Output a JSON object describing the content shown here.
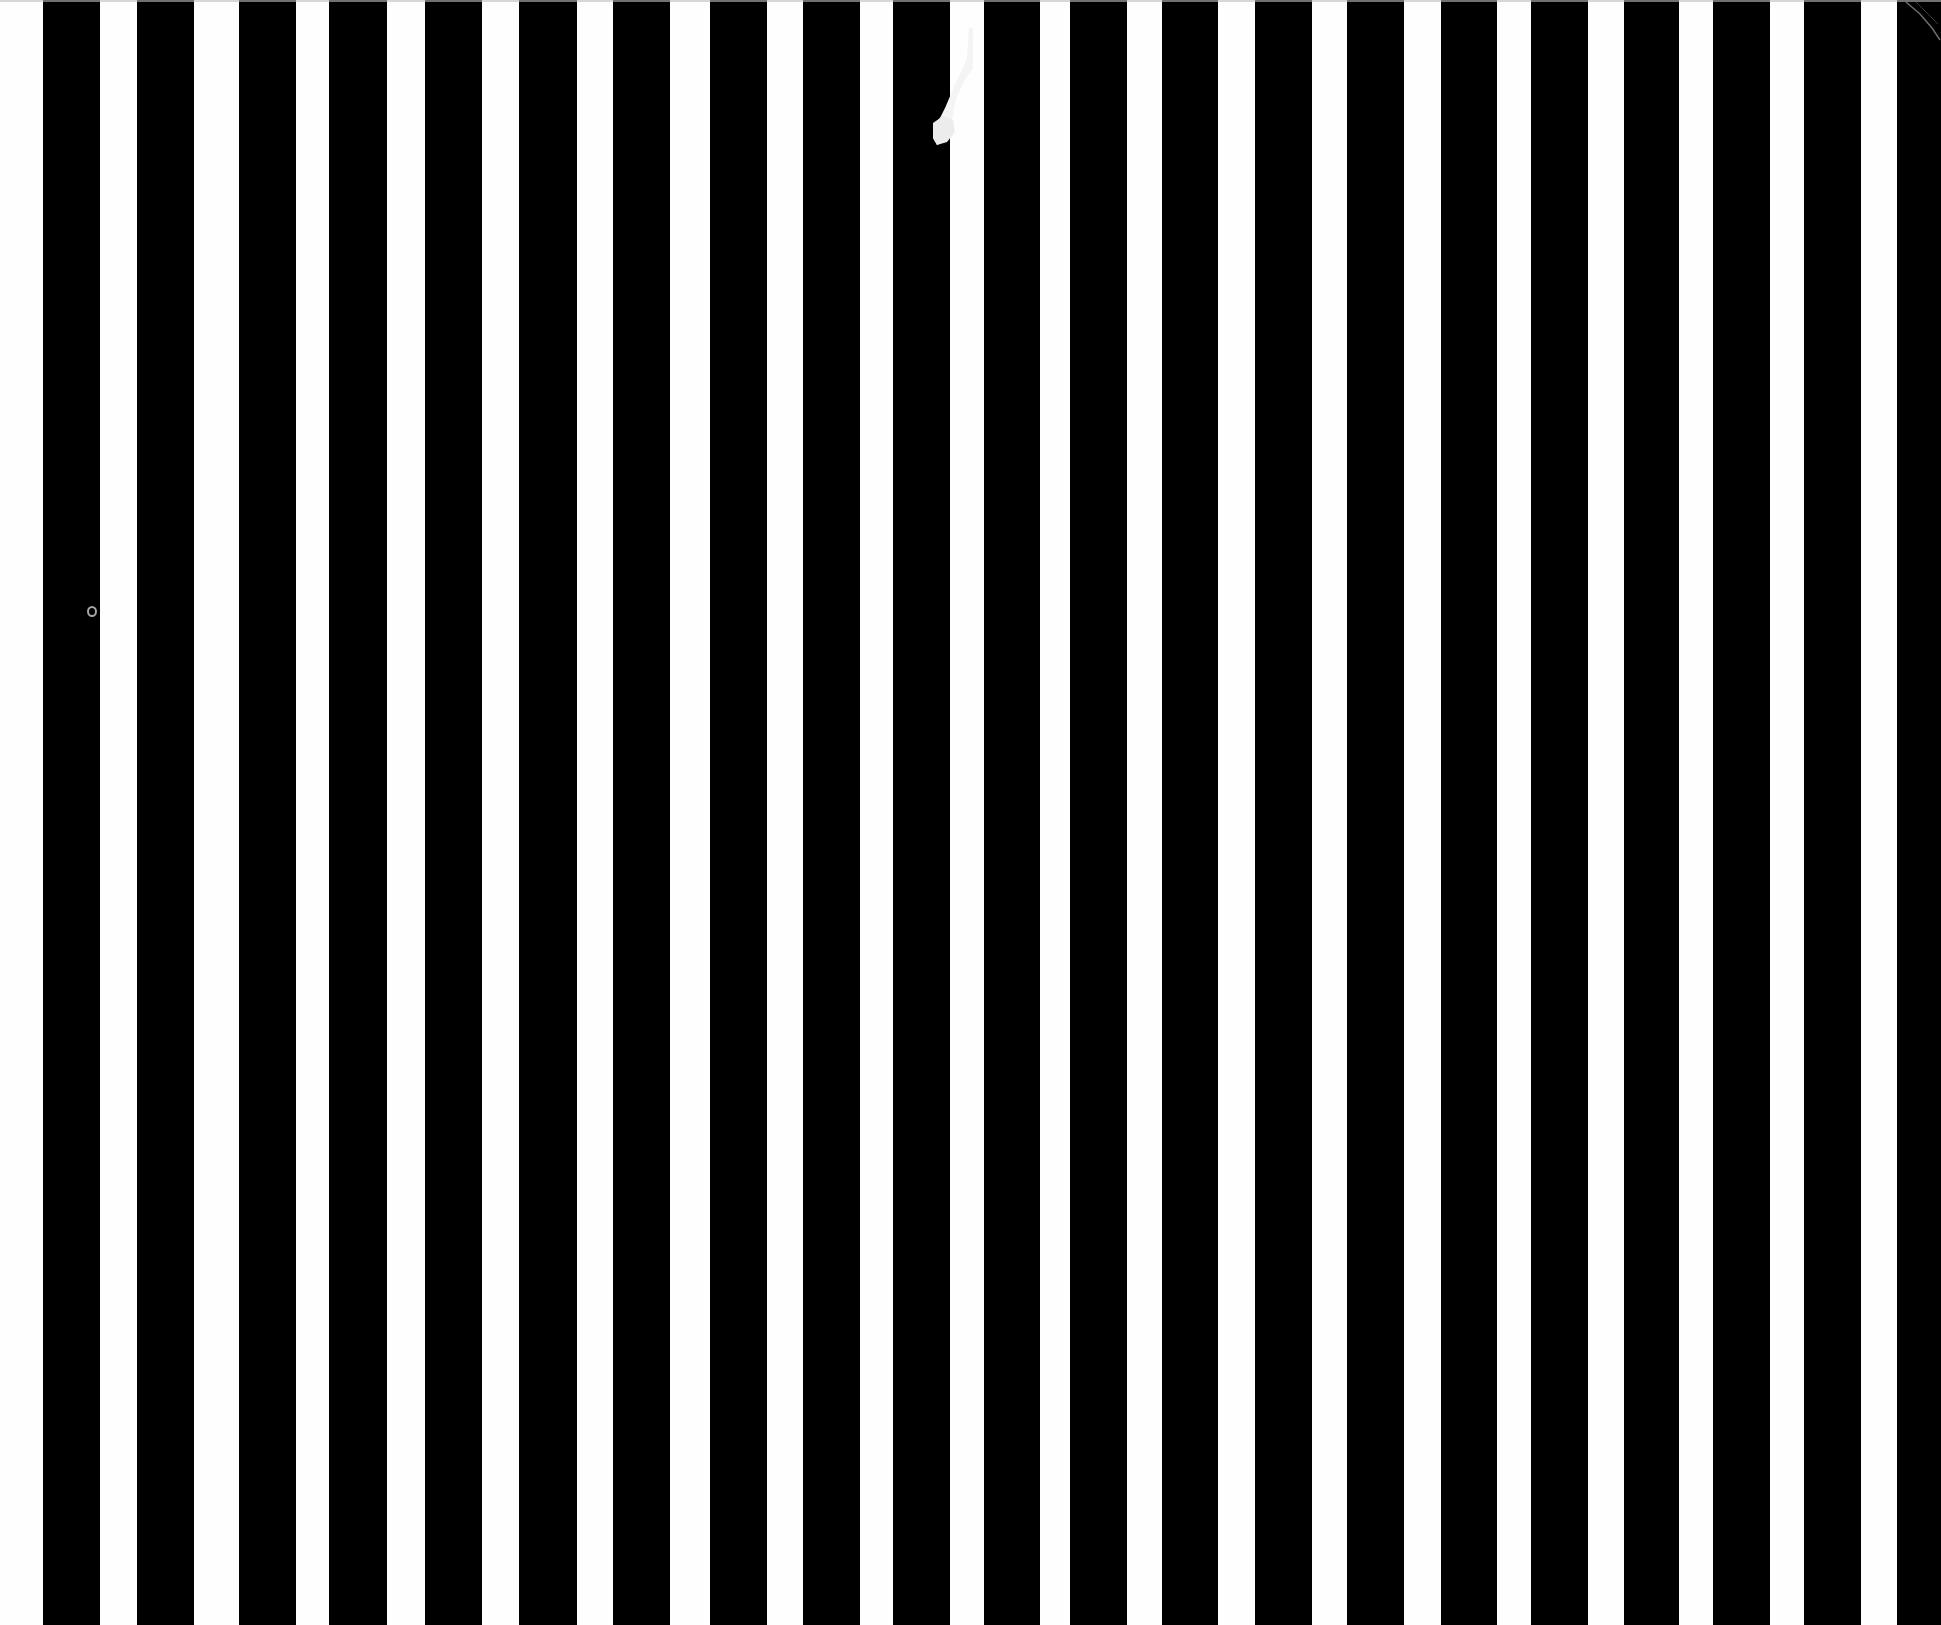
{
  "artwork": {
    "width": 1941,
    "height": 1625,
    "pattern": "vertical black and white stripes",
    "colors": {
      "background": "#fefefe",
      "stripe": "#000000"
    },
    "black_stripes": [
      [
        43,
        100
      ],
      [
        137,
        194
      ],
      [
        239,
        296
      ],
      [
        329,
        387
      ],
      [
        425,
        482
      ],
      [
        519,
        577
      ],
      [
        613,
        670
      ],
      [
        710,
        767
      ],
      [
        803,
        860
      ],
      [
        893,
        950
      ],
      [
        984,
        1040
      ],
      [
        1070,
        1127
      ],
      [
        1162,
        1218
      ],
      [
        1255,
        1312
      ],
      [
        1347,
        1404
      ],
      [
        1441,
        1497
      ],
      [
        1531,
        1588
      ],
      [
        1624,
        1679
      ],
      [
        1713,
        1770
      ],
      [
        1804,
        1861
      ],
      [
        1897,
        1941
      ]
    ],
    "marks": [
      {
        "type": "tear",
        "x": 933,
        "y": 28
      },
      {
        "type": "dust-ring",
        "x": 92,
        "y": 612
      },
      {
        "type": "corner-scratch",
        "x": 1900,
        "y": 0
      }
    ]
  }
}
